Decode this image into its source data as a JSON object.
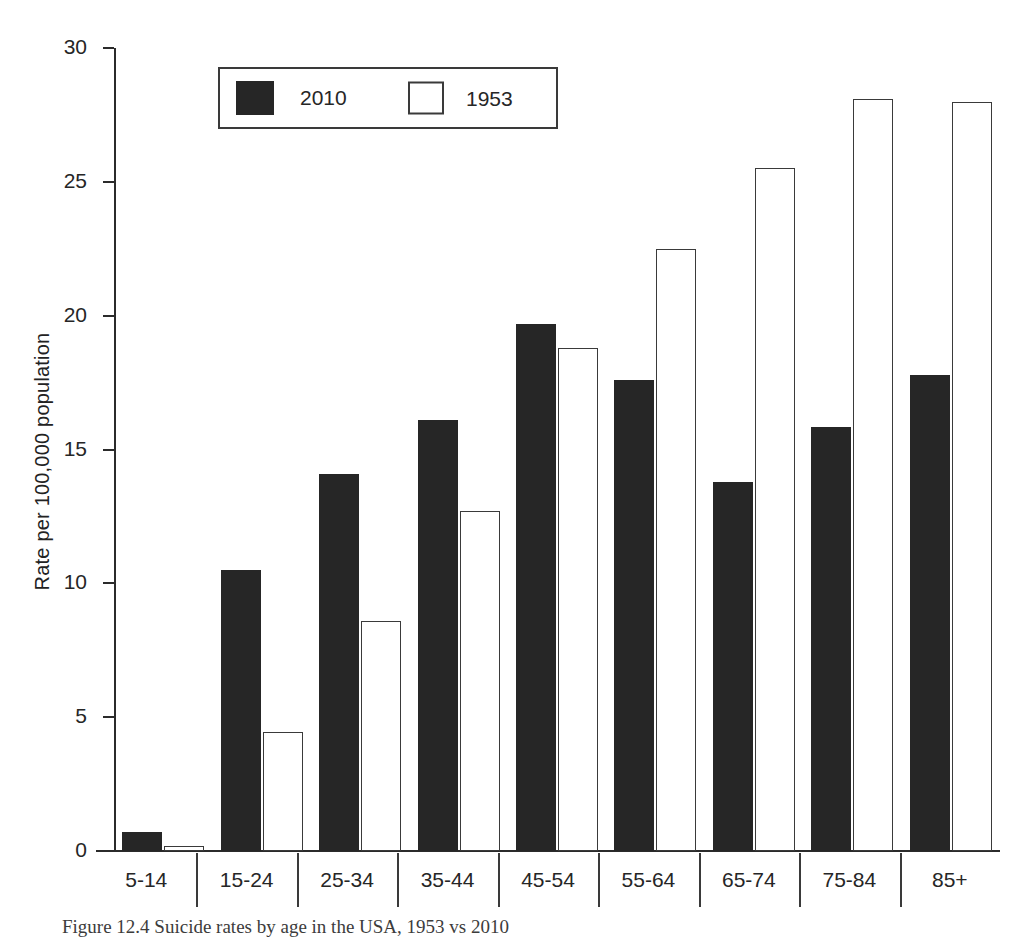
{
  "chart_data": {
    "type": "bar",
    "title": "",
    "subtitle": "",
    "xlabel": "",
    "ylabel": "Rate per 100,000 population",
    "categories": [
      "5-14",
      "15-24",
      "25-34",
      "35-44",
      "45-54",
      "55-64",
      "65-74",
      "75-84",
      "85+"
    ],
    "series": [
      {
        "name": "2010",
        "color": "#262626",
        "values": [
          0.7,
          10.5,
          14.1,
          16.1,
          19.7,
          17.6,
          13.8,
          15.85,
          17.8
        ]
      },
      {
        "name": "1953",
        "color": "#ffffff",
        "values": [
          0.2,
          4.45,
          8.6,
          12.7,
          18.8,
          22.5,
          25.5,
          28.1,
          28.0
        ]
      }
    ],
    "ylim": [
      0,
      30
    ],
    "yticks": [
      0,
      5,
      10,
      15,
      20,
      25,
      30
    ],
    "ytick_labels": [
      "0",
      "5",
      "10",
      "15",
      "20",
      "25",
      "30"
    ],
    "grid": false,
    "legend_position": "top-left-inside",
    "annotations": []
  },
  "legend": {
    "items": [
      {
        "label": "2010",
        "style": "filled-dark"
      },
      {
        "label": "1953",
        "style": "outlined-white"
      }
    ]
  },
  "caption": {
    "text": "Figure 12.4 Suicide rates by age in the USA, 1953 vs 2010"
  }
}
